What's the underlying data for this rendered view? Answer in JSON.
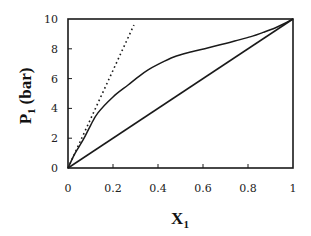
{
  "chart_data": {
    "type": "line",
    "title": "",
    "xlabel": "X",
    "xlabel_subscript": "1",
    "ylabel": "P",
    "ylabel_subscript": "1",
    "ylabel_unit": "(bar)",
    "xlim": [
      0,
      1
    ],
    "ylim": [
      0,
      10
    ],
    "grid": false,
    "legend": "none",
    "x_ticks": [
      0,
      0.2,
      0.4,
      0.6,
      0.8,
      1
    ],
    "x_tick_labels": [
      "0",
      "0.2",
      "0.4",
      "0.6",
      "0.8",
      "1"
    ],
    "y_ticks": [
      0,
      2,
      4,
      6,
      8,
      10
    ],
    "y_tick_labels": [
      "0",
      "2",
      "4",
      "6",
      "8",
      "10"
    ],
    "series": [
      {
        "name": "actual-partial-pressure",
        "style": "solid",
        "color": "#1a1a1a",
        "x": [
          0,
          0.03,
          0.067,
          0.1,
          0.133,
          0.2,
          0.267,
          0.32,
          0.356,
          0.4,
          0.47,
          0.55,
          0.62,
          0.7,
          0.76,
          0.82,
          0.867,
          0.92,
          0.96,
          1.0
        ],
        "y": [
          0,
          0.95,
          1.88,
          2.85,
          3.7,
          4.77,
          5.57,
          6.2,
          6.58,
          6.95,
          7.45,
          7.8,
          8.05,
          8.35,
          8.6,
          8.85,
          9.1,
          9.4,
          9.68,
          10
        ]
      },
      {
        "name": "raoults-law",
        "style": "solid",
        "color": "#1a1a1a",
        "x": [
          0,
          1
        ],
        "y": [
          0,
          10
        ]
      },
      {
        "name": "henrys-law",
        "style": "dotted",
        "color": "#1a1a1a",
        "x": [
          0,
          0.293
        ],
        "y": [
          0,
          9.6
        ]
      }
    ]
  }
}
